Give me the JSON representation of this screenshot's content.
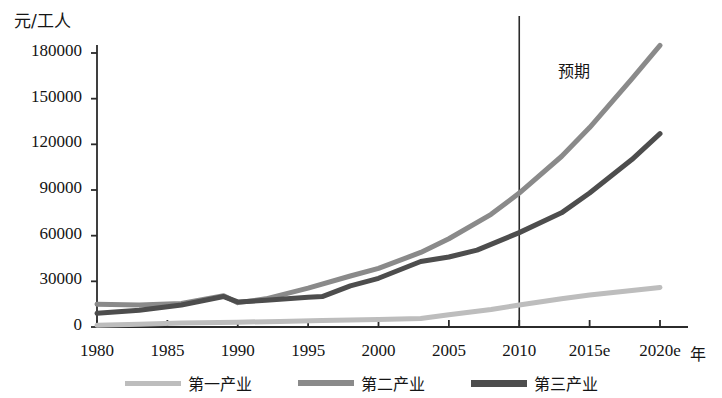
{
  "chart_data": {
    "type": "line",
    "title": "",
    "xlabel": "年",
    "ylabel": "元/工人",
    "grid": false,
    "legend_position": "bottom",
    "x": [
      1980,
      1985,
      1990,
      1995,
      2000,
      2005,
      2010,
      2015,
      2020
    ],
    "xtick_labels": [
      "1980",
      "1985",
      "1990",
      "1995",
      "2000",
      "2005",
      "2010",
      "2015e",
      "2020e"
    ],
    "ytick_labels": [
      "0",
      "30000",
      "60000",
      "90000",
      "120000",
      "150000",
      "180000"
    ],
    "ytick_values": [
      0,
      30000,
      60000,
      90000,
      120000,
      150000,
      180000
    ],
    "ylim": [
      0,
      190000
    ],
    "xlim": [
      1980,
      2020
    ],
    "annotations": [
      {
        "text": "预期",
        "x": 2011.5,
        "y": 170000,
        "note": "forecast region label right of divider"
      }
    ],
    "divider": {
      "x": 2010,
      "label": "预期起点"
    },
    "series": [
      {
        "name": "第一产业",
        "color": "#bdbdbd",
        "width": 5,
        "points": [
          {
            "x": 1980,
            "y": 1200
          },
          {
            "x": 1983,
            "y": 1800
          },
          {
            "x": 1986,
            "y": 2600
          },
          {
            "x": 1990,
            "y": 3200
          },
          {
            "x": 1993,
            "y": 3600
          },
          {
            "x": 1996,
            "y": 4200
          },
          {
            "x": 2000,
            "y": 5000
          },
          {
            "x": 2003,
            "y": 5600
          },
          {
            "x": 2005,
            "y": 8000
          },
          {
            "x": 2008,
            "y": 11500
          },
          {
            "x": 2010,
            "y": 14500
          },
          {
            "x": 2013,
            "y": 18500
          },
          {
            "x": 2015,
            "y": 21000
          },
          {
            "x": 2018,
            "y": 24000
          },
          {
            "x": 2020,
            "y": 26000
          }
        ]
      },
      {
        "name": "第二产业",
        "color": "#8a8a8a",
        "width": 5,
        "points": [
          {
            "x": 1980,
            "y": 15000
          },
          {
            "x": 1983,
            "y": 14500
          },
          {
            "x": 1986,
            "y": 15500
          },
          {
            "x": 1989,
            "y": 20500
          },
          {
            "x": 1990,
            "y": 16000
          },
          {
            "x": 1992,
            "y": 18500
          },
          {
            "x": 1995,
            "y": 25500
          },
          {
            "x": 1998,
            "y": 33500
          },
          {
            "x": 2000,
            "y": 38500
          },
          {
            "x": 2003,
            "y": 49000
          },
          {
            "x": 2005,
            "y": 58000
          },
          {
            "x": 2008,
            "y": 74000
          },
          {
            "x": 2010,
            "y": 88000
          },
          {
            "x": 2013,
            "y": 112000
          },
          {
            "x": 2015,
            "y": 131000
          },
          {
            "x": 2018,
            "y": 163000
          },
          {
            "x": 2020,
            "y": 185000
          }
        ]
      },
      {
        "name": "第三产业",
        "color": "#4d4d4d",
        "width": 5,
        "points": [
          {
            "x": 1980,
            "y": 9000
          },
          {
            "x": 1983,
            "y": 11000
          },
          {
            "x": 1986,
            "y": 14500
          },
          {
            "x": 1989,
            "y": 20000
          },
          {
            "x": 1990,
            "y": 16500
          },
          {
            "x": 1992,
            "y": 17500
          },
          {
            "x": 1995,
            "y": 19500
          },
          {
            "x": 1996,
            "y": 20000
          },
          {
            "x": 1998,
            "y": 27000
          },
          {
            "x": 2000,
            "y": 32000
          },
          {
            "x": 2003,
            "y": 43000
          },
          {
            "x": 2005,
            "y": 46000
          },
          {
            "x": 2007,
            "y": 50500
          },
          {
            "x": 2010,
            "y": 62000
          },
          {
            "x": 2013,
            "y": 75000
          },
          {
            "x": 2015,
            "y": 88000
          },
          {
            "x": 2018,
            "y": 110000
          },
          {
            "x": 2020,
            "y": 127000
          }
        ]
      }
    ]
  },
  "axis": {
    "y_unit": "元/工人",
    "x_unit": "年"
  },
  "ticks": {
    "y": [
      {
        "label": "180000",
        "value": 180000
      },
      {
        "label": "150000",
        "value": 150000
      },
      {
        "label": "120000",
        "value": 120000
      },
      {
        "label": "90000",
        "value": 90000
      },
      {
        "label": "60000",
        "value": 60000
      },
      {
        "label": "30000",
        "value": 30000
      },
      {
        "label": "0",
        "value": 0
      }
    ],
    "x": [
      {
        "label": "1980",
        "value": 1980
      },
      {
        "label": "1985",
        "value": 1985
      },
      {
        "label": "1990",
        "value": 1990
      },
      {
        "label": "1995",
        "value": 1995
      },
      {
        "label": "2000",
        "value": 2000
      },
      {
        "label": "2005",
        "value": 2005
      },
      {
        "label": "2010",
        "value": 2010
      },
      {
        "label": "2015e",
        "value": 2015
      },
      {
        "label": "2020e",
        "value": 2020
      }
    ]
  },
  "forecast_label": "预期",
  "legend": [
    {
      "label": "第一产业",
      "color": "#bdbdbd"
    },
    {
      "label": "第二产业",
      "color": "#8a8a8a"
    },
    {
      "label": "第三产业",
      "color": "#4d4d4d"
    }
  ]
}
